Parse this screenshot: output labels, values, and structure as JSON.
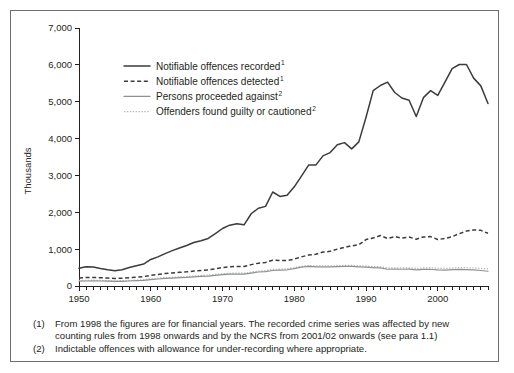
{
  "figure": {
    "y_axis_title": "Thousands",
    "y_ticks": [
      "0",
      "1,000",
      "2,000",
      "3,000",
      "4,000",
      "5,000",
      "6,000",
      "7,000"
    ],
    "x_ticks": [
      "1950",
      "1960",
      "1970",
      "1980",
      "1990",
      "2000"
    ],
    "legend": [
      {
        "label": "Notifiable offences recorded",
        "sup": "1",
        "style": "solid-black",
        "name": "legend-item-notifiable-offences-recorded"
      },
      {
        "label": "Notifiable offences detected",
        "sup": "1",
        "style": "dashed-black",
        "name": "legend-item-notifiable-offences-detected"
      },
      {
        "label": "Persons proceeded against",
        "sup": "2",
        "style": "solid-grey",
        "name": "legend-item-persons-proceeded-against"
      },
      {
        "label": "Offenders found guilty or cautioned",
        "sup": "2",
        "style": "dotted-grey",
        "name": "legend-item-offenders-found-guilty-or-cautioned"
      }
    ],
    "notes": [
      {
        "num": "(1)",
        "text": "From 1998 the figures are for financial years. The recorded crime series was affected by new counting rules from 1998 onwards and by the NCRS from 2001/02 onwards (see para 1.1)"
      },
      {
        "num": "(2)",
        "text": "Indictable offences with allowance for under-recording where appropriate."
      }
    ],
    "colors": {
      "recorded": "#3b3b3b",
      "detected": "#3b3b3b",
      "proceeded": "#8e9094",
      "cautioned": "#b4b6ba",
      "axis": "#231f20",
      "frame": "#6d6e71"
    }
  },
  "chart_data": {
    "type": "line",
    "title": "",
    "xlabel": "",
    "ylabel": "Thousands",
    "xlim": [
      1950,
      2007
    ],
    "ylim": [
      0,
      7000
    ],
    "grid": false,
    "legend_position": "top-center-inside",
    "x": [
      1950,
      1951,
      1952,
      1953,
      1954,
      1955,
      1956,
      1957,
      1958,
      1959,
      1960,
      1961,
      1962,
      1963,
      1964,
      1965,
      1966,
      1967,
      1968,
      1969,
      1970,
      1971,
      1972,
      1973,
      1974,
      1975,
      1976,
      1977,
      1978,
      1979,
      1980,
      1981,
      1982,
      1983,
      1984,
      1985,
      1986,
      1987,
      1988,
      1989,
      1990,
      1991,
      1992,
      1993,
      1994,
      1995,
      1996,
      1997,
      1998,
      1999,
      2000,
      2001,
      2002,
      2003,
      2004,
      2005,
      2006,
      2007
    ],
    "series": [
      {
        "name": "Notifiable offences recorded",
        "footnote": "1",
        "style": "solid",
        "color": "#3b3b3b",
        "values": [
          480,
          525,
          515,
          475,
          440,
          415,
          440,
          500,
          550,
          595,
          720,
          790,
          880,
          960,
          1030,
          1100,
          1180,
          1230,
          1290,
          1420,
          1560,
          1650,
          1690,
          1660,
          1960,
          2110,
          2160,
          2550,
          2430,
          2460,
          2690,
          2980,
          3280,
          3280,
          3530,
          3620,
          3830,
          3890,
          3720,
          3910,
          4580,
          5300,
          5440,
          5530,
          5250,
          5100,
          5040,
          4600,
          5110,
          5300,
          5170,
          5530,
          5900,
          6010,
          6010,
          5640,
          5430,
          4950
        ]
      },
      {
        "name": "Notifiable offences detected",
        "footnote": "1",
        "style": "dashed",
        "color": "#3b3b3b",
        "values": [
          220,
          230,
          230,
          225,
          215,
          205,
          210,
          225,
          240,
          255,
          290,
          315,
          340,
          355,
          370,
          385,
          405,
          420,
          435,
          465,
          500,
          520,
          530,
          530,
          580,
          620,
          640,
          700,
          690,
          690,
          730,
          790,
          840,
          860,
          920,
          940,
          1000,
          1050,
          1090,
          1120,
          1260,
          1300,
          1370,
          1290,
          1340,
          1300,
          1330,
          1270,
          1330,
          1340,
          1260,
          1290,
          1340,
          1420,
          1490,
          1520,
          1510,
          1430
        ]
      },
      {
        "name": "Persons proceeded against",
        "footnote": "2",
        "style": "solid-grey",
        "color": "#8e9094",
        "values": [
          130,
          135,
          140,
          135,
          130,
          125,
          128,
          135,
          145,
          155,
          175,
          190,
          205,
          215,
          225,
          235,
          250,
          260,
          270,
          290,
          310,
          320,
          325,
          320,
          350,
          380,
          390,
          420,
          430,
          440,
          470,
          510,
          530,
          520,
          520,
          520,
          525,
          530,
          530,
          520,
          510,
          500,
          490,
          455,
          460,
          455,
          460,
          440,
          450,
          455,
          440,
          430,
          445,
          450,
          445,
          435,
          420,
          400
        ]
      },
      {
        "name": "Offenders found guilty or cautioned",
        "footnote": "2",
        "style": "dotted-grey",
        "color": "#b4b6ba",
        "values": [
          150,
          155,
          158,
          152,
          146,
          140,
          145,
          152,
          162,
          172,
          195,
          212,
          228,
          238,
          248,
          258,
          272,
          284,
          295,
          315,
          335,
          345,
          350,
          348,
          378,
          405,
          418,
          450,
          460,
          468,
          498,
          535,
          558,
          548,
          550,
          548,
          552,
          558,
          558,
          548,
          540,
          530,
          520,
          490,
          495,
          492,
          498,
          478,
          490,
          498,
          482,
          476,
          490,
          500,
          495,
          488,
          478,
          465
        ]
      }
    ]
  }
}
